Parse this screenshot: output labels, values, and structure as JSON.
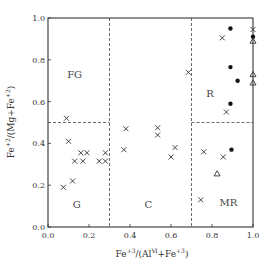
{
  "chart_data": {
    "type": "scatter",
    "title": "",
    "xlabel": "Fe+3/(Al VI + Fe+3)",
    "ylabel": "Fe+2/(Mg + Fe+2)",
    "xlim": [
      0.0,
      1.0
    ],
    "ylim": [
      0.0,
      1.0
    ],
    "x_ticks": [
      "0.0",
      "0.2",
      "0.4",
      "0.6",
      "0.8",
      "1.0"
    ],
    "y_ticks": [
      "0.0",
      "0.2",
      "0.4",
      "0.6",
      "0.8",
      "1.0"
    ],
    "grid": false,
    "legend": null,
    "region_dividers": {
      "vertical_dashed_x": [
        0.3,
        0.7
      ],
      "horizontal_dashed_segments": [
        {
          "y": 0.5,
          "x_from": 0.0,
          "x_to": 0.3
        },
        {
          "y": 0.5,
          "x_from": 0.7,
          "x_to": 1.0
        }
      ]
    },
    "region_labels": [
      {
        "text": "FG",
        "x": 0.13,
        "y": 0.73
      },
      {
        "text": "G",
        "x": 0.14,
        "y": 0.11
      },
      {
        "text": "C",
        "x": 0.49,
        "y": 0.11
      },
      {
        "text": "R",
        "x": 0.79,
        "y": 0.64
      },
      {
        "text": "MR",
        "x": 0.88,
        "y": 0.12
      }
    ],
    "series": [
      {
        "name": "cross",
        "marker": "x",
        "points": [
          [
            0.09,
            0.52
          ],
          [
            0.1,
            0.41
          ],
          [
            0.16,
            0.355
          ],
          [
            0.19,
            0.355
          ],
          [
            0.13,
            0.315
          ],
          [
            0.17,
            0.315
          ],
          [
            0.25,
            0.315
          ],
          [
            0.28,
            0.315
          ],
          [
            0.28,
            0.355
          ],
          [
            0.12,
            0.22
          ],
          [
            0.075,
            0.19
          ],
          [
            0.38,
            0.47
          ],
          [
            0.37,
            0.37
          ],
          [
            0.535,
            0.475
          ],
          [
            0.535,
            0.44
          ],
          [
            0.62,
            0.38
          ],
          [
            0.6,
            0.335
          ],
          [
            0.685,
            0.74
          ],
          [
            0.85,
            0.905
          ],
          [
            0.87,
            0.55
          ],
          [
            0.76,
            0.36
          ],
          [
            0.855,
            0.335
          ],
          [
            0.745,
            0.13
          ],
          [
            1.0,
            0.945
          ]
        ]
      },
      {
        "name": "filled-circle",
        "marker": "o",
        "points": [
          [
            0.89,
            0.95
          ],
          [
            0.89,
            0.765
          ],
          [
            0.925,
            0.7
          ],
          [
            0.89,
            0.59
          ],
          [
            0.895,
            0.37
          ],
          [
            1.0,
            0.91
          ]
        ]
      },
      {
        "name": "triangle",
        "marker": "^",
        "points": [
          [
            0.825,
            0.255
          ],
          [
            1.0,
            0.89
          ],
          [
            1.0,
            0.73
          ],
          [
            1.0,
            0.69
          ]
        ]
      }
    ]
  },
  "axes": {
    "x_title_main": "Fe",
    "x_title_sup1": "+3",
    "x_title_mid": "/(Al",
    "x_title_sup2": "Ⅵ",
    "x_title_mid2": "+Fe",
    "x_title_sup3": "+3",
    "x_title_end": ")",
    "y_title_main": "Fe",
    "y_title_sup1": "+2",
    "y_title_mid": "/(Mg+Fe",
    "y_title_sup2": "+2",
    "y_title_end": ")"
  }
}
